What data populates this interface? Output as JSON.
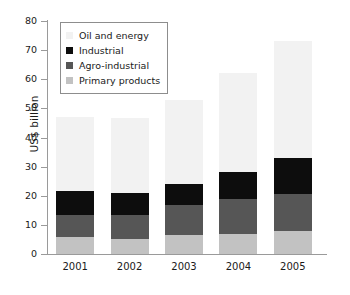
{
  "chart_data": {
    "type": "bar",
    "subtype": "stacked-bar",
    "title": "",
    "xlabel": "",
    "ylabel": "US$ billion",
    "categories": [
      "2001",
      "2002",
      "2003",
      "2004",
      "2005"
    ],
    "ylim": [
      0,
      80
    ],
    "y_ticks": [
      0,
      10,
      20,
      30,
      40,
      50,
      60,
      70,
      80
    ],
    "y_tick_labels": [
      "0",
      "10",
      "20",
      "30",
      "40",
      "50",
      "60",
      "70",
      "80"
    ],
    "grid": false,
    "legend_position": "upper-left-inside",
    "stack_order_bottom_to_top": [
      "Primary products",
      "Agro-industrial",
      "Industrial",
      "Oil and energy"
    ],
    "series": [
      {
        "name": "Primary products",
        "color": "#c2c2c2",
        "values": [
          6.0,
          5.2,
          6.5,
          6.8,
          7.8
        ]
      },
      {
        "name": "Agro-industrial",
        "color": "#565656",
        "values": [
          7.5,
          8.1,
          10.2,
          12.0,
          12.7
        ]
      },
      {
        "name": "Industrial",
        "color": "#0d0d0d",
        "values": [
          8.2,
          7.7,
          7.5,
          9.5,
          12.5
        ]
      },
      {
        "name": "Oil and energy",
        "color": "#f2f2f2",
        "values": [
          25.3,
          25.8,
          28.8,
          33.7,
          40.0
        ]
      }
    ],
    "totals": [
      47.0,
      46.8,
      53.0,
      62.0,
      73.0
    ]
  },
  "legend": {
    "entries": [
      {
        "label": "Oil and energy",
        "color": "#f2f2f2"
      },
      {
        "label": "Industrial",
        "color": "#0d0d0d"
      },
      {
        "label": "Agro-industrial",
        "color": "#565656"
      },
      {
        "label": "Primary products",
        "color": "#c2c2c2"
      }
    ]
  },
  "axis": {
    "y_title": "US$ billion"
  }
}
